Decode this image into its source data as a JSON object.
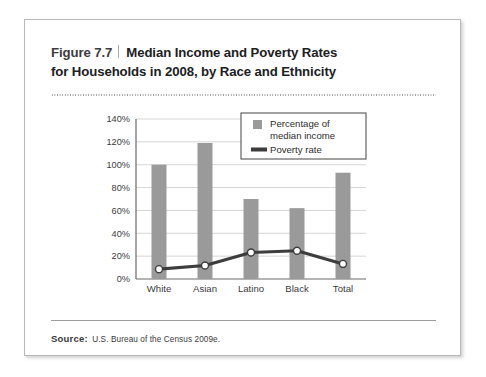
{
  "figure": {
    "number": "Figure 7.7",
    "title_line1": "Median Income and Poverty Rates",
    "title_line2": "for Households in 2008, by Race and Ethnicity",
    "source_label": "Source:",
    "source_text": "U.S. Bureau of the Census 2009e."
  },
  "chart_data": {
    "type": "bar",
    "title": "Median Income and Poverty Rates for Households in 2008, by Race and Ethnicity",
    "xlabel": "",
    "ylabel": "",
    "categories": [
      "White",
      "Asian",
      "Latino",
      "Black",
      "Total"
    ],
    "ylim": [
      0,
      140
    ],
    "ytick_labels": [
      "0%",
      "20%",
      "40%",
      "60%",
      "80%",
      "100%",
      "120%",
      "140%"
    ],
    "ytick_values": [
      0,
      20,
      40,
      60,
      80,
      100,
      120,
      140
    ],
    "grid": true,
    "legend_position": "top-right",
    "series": [
      {
        "name": "Percentage of median income",
        "type": "bar",
        "color": "#9a9a9a",
        "values": [
          100,
          119,
          70,
          62,
          93
        ]
      },
      {
        "name": "Poverty rate",
        "type": "line",
        "color": "#3d3d3d",
        "marker_fill": "#ffffff",
        "values": [
          8.6,
          11.8,
          23.2,
          24.7,
          13.2
        ]
      }
    ]
  },
  "legend": {
    "entries": [
      {
        "label_line1": "Percentage of",
        "label_line2": "median income",
        "swatch": "bar-swatch"
      },
      {
        "label_line1": "Poverty rate",
        "label_line2": "",
        "swatch": "line-swatch"
      }
    ]
  },
  "colors": {
    "bar": "#9a9a9a",
    "line": "#3d3d3d",
    "grid": "#d5d5d5",
    "axis": "#6b6b6b",
    "card_border": "#b9b9bb"
  }
}
